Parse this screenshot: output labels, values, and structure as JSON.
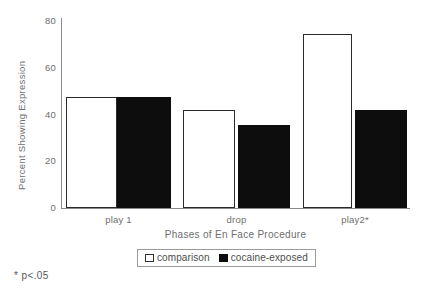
{
  "chart_data": {
    "type": "bar",
    "title": "",
    "xlabel": "Phases of En Face Procedure",
    "ylabel": "Percent Showing Expression",
    "categories": [
      "play 1",
      "drop",
      "play2*"
    ],
    "series": [
      {
        "name": "comparison",
        "color": "#ffffff",
        "values": [
          47.5,
          42.0,
          74.5
        ]
      },
      {
        "name": "cocaine-exposed",
        "color": "#0d0d0d",
        "values": [
          47.5,
          35.5,
          42.0
        ]
      }
    ],
    "ylim": [
      0,
      80
    ],
    "yticks": [
      0,
      20,
      40,
      60,
      80
    ],
    "ytick_labels": [
      "0",
      "20",
      "40",
      "60",
      "80"
    ],
    "grid": false,
    "legend_position": "bottom-center",
    "annotations": [
      "* p<.05"
    ]
  },
  "axes": {
    "y_title": "Percent Showing Expression",
    "x_title": "Phases of En Face Procedure",
    "y_ticks": [
      {
        "label": "80",
        "value": 80
      },
      {
        "label": "60",
        "value": 60
      },
      {
        "label": "40",
        "value": 40
      },
      {
        "label": "20",
        "value": 20
      },
      {
        "label": "0",
        "value": 0
      }
    ],
    "x_ticks": [
      {
        "label": "play 1"
      },
      {
        "label": "drop"
      },
      {
        "label": "play2*"
      }
    ]
  },
  "legend": {
    "entries": [
      {
        "label": "comparison",
        "swatch": "white-square-icon"
      },
      {
        "label": "cocaine-exposed",
        "swatch": "black-square-icon"
      }
    ]
  },
  "footnote": {
    "text": "* p<.05"
  },
  "bars": [
    {
      "group": "play 1",
      "series": "comparison",
      "value": 47.5,
      "left": 66,
      "width": 51
    },
    {
      "group": "play 1",
      "series": "cocaine-exposed",
      "value": 47.5,
      "left": 117,
      "width": 54
    },
    {
      "group": "drop",
      "series": "comparison",
      "value": 42.0,
      "left": 183,
      "width": 52
    },
    {
      "group": "drop",
      "series": "cocaine-exposed",
      "value": 35.5,
      "left": 238,
      "width": 52
    },
    {
      "group": "play2*",
      "series": "comparison",
      "value": 74.5,
      "left": 303,
      "width": 49
    },
    {
      "group": "play2*",
      "series": "cocaine-exposed",
      "value": 42.0,
      "left": 355,
      "width": 52
    }
  ],
  "colors": {
    "comparison_fill": "#ffffff",
    "comparison_stroke": "#2a2a2a",
    "exposed_fill": "#0d0d0d",
    "axis": "#8a8a8a",
    "text": "#6e6e6e"
  }
}
